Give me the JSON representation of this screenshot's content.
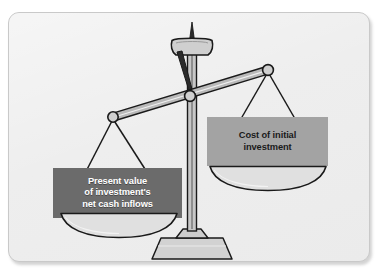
{
  "figure": {
    "name": "balance-scale-npv-diagram",
    "background_color": "#ffffff",
    "card_color": "#eeeeee",
    "card_border_color": "#c9c9c9"
  },
  "scale": {
    "line_color": "#1a1a1a",
    "metal_fill": "#cfcfcf",
    "pan_fill": "#dcdcdc",
    "beam_fill": "#b9b9b9",
    "pivot": {
      "x": 190,
      "y": 96,
      "r": 5.2
    },
    "left_arm_end": {
      "x": 113,
      "y": 117,
      "r": 5.0
    },
    "right_arm_end": {
      "x": 268,
      "y": 70,
      "r": 5.2
    },
    "column": {
      "x": 192,
      "top": 48,
      "bottom": 232
    },
    "base": {
      "x": 192,
      "y": 248
    },
    "left_pan": {
      "cx": 119,
      "cy": 217,
      "rx": 58,
      "ry": 11
    },
    "right_pan": {
      "cx": 268,
      "cy": 170,
      "rx": 58,
      "ry": 11
    }
  },
  "labels": {
    "left": {
      "id": "present-value-label",
      "text": "Present value of investment's net cash inflows",
      "line1": "Present value",
      "line2": "of investment's",
      "line3": "net cash inflows",
      "background_color": "#6b6b6b",
      "text_color": "#ffffff"
    },
    "right": {
      "id": "cost-of-investment-label",
      "text": "Cost of initial investment",
      "line1": "Cost of initial",
      "line2": "investment",
      "background_color": "#a3a3a3",
      "text_color": "#1a1a1a"
    }
  }
}
